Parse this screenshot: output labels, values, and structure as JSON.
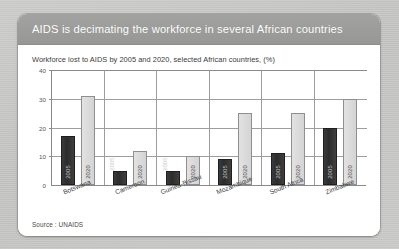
{
  "page": {
    "background_color": "#c9c9c7",
    "card_background": "#ffffff",
    "header_band_color": "#9b9b99"
  },
  "header": {
    "title": "AIDS is decimating the workforce in several African countries"
  },
  "source": {
    "text": "Source : UNAIDS"
  },
  "chart_data": {
    "type": "bar",
    "title": "Workforce lost to AIDS by 2005 and 2020, selected African countries, (%)",
    "xlabel": "",
    "ylabel": "",
    "ylim": [
      0,
      40
    ],
    "yticks": [
      "0",
      "10",
      "20",
      "30",
      "40"
    ],
    "ytick_values": [
      0,
      10,
      20,
      30,
      40
    ],
    "grid": true,
    "legend": "none",
    "categories": [
      "Botswana",
      "Cameroon",
      "Guinea-Bissau",
      "Mozambique",
      "South Africa",
      "Zimbabwe"
    ],
    "series": [
      {
        "name": "2005",
        "color": "#333333",
        "values": [
          17,
          5,
          5,
          9,
          11,
          19.7
        ]
      },
      {
        "name": "2020",
        "color": "#dcdcdc",
        "values": [
          31,
          12,
          10,
          25,
          25,
          30
        ]
      }
    ],
    "bar_labels": [
      {
        "category": "Botswana",
        "series": "2005",
        "label": "2005",
        "placement": "inside"
      },
      {
        "category": "Botswana",
        "series": "2020",
        "label": "2020",
        "placement": "inside"
      },
      {
        "category": "Cameroon",
        "series": "2005",
        "label": "2005",
        "placement": "above"
      },
      {
        "category": "Cameroon",
        "series": "2020",
        "label": "2020",
        "placement": "inside"
      },
      {
        "category": "Guinea-Bissau",
        "series": "2005",
        "label": "2005",
        "placement": "above"
      },
      {
        "category": "Guinea-Bissau",
        "series": "2020",
        "label": "2020",
        "placement": "inside"
      },
      {
        "category": "Mozambique",
        "series": "2005",
        "label": "2005",
        "placement": "inside"
      },
      {
        "category": "Mozambique",
        "series": "2020",
        "label": "2020",
        "placement": "inside"
      },
      {
        "category": "South Africa",
        "series": "2005",
        "label": "2005",
        "placement": "inside"
      },
      {
        "category": "South Africa",
        "series": "2020",
        "label": "2020",
        "placement": "inside"
      },
      {
        "category": "Zimbabwe",
        "series": "2005",
        "label": "2005",
        "placement": "inside"
      },
      {
        "category": "Zimbabwe",
        "series": "2020",
        "label": "2020",
        "placement": "inside"
      }
    ]
  }
}
